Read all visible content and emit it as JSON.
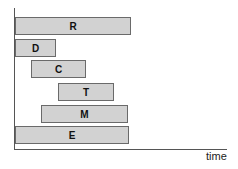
{
  "diagram": {
    "x_axis_label": "time",
    "bars": [
      {
        "label": "R",
        "left": 15,
        "top": 17,
        "width": 116,
        "height": 18
      },
      {
        "label": "D",
        "left": 15,
        "top": 39,
        "width": 41,
        "height": 18
      },
      {
        "label": "C",
        "left": 31,
        "top": 60,
        "width": 55,
        "height": 18
      },
      {
        "label": "T",
        "left": 58,
        "top": 83,
        "width": 56,
        "height": 18
      },
      {
        "label": "M",
        "left": 41,
        "top": 105,
        "width": 87,
        "height": 18
      },
      {
        "label": "E",
        "left": 15,
        "top": 126,
        "width": 114,
        "height": 18
      }
    ]
  }
}
